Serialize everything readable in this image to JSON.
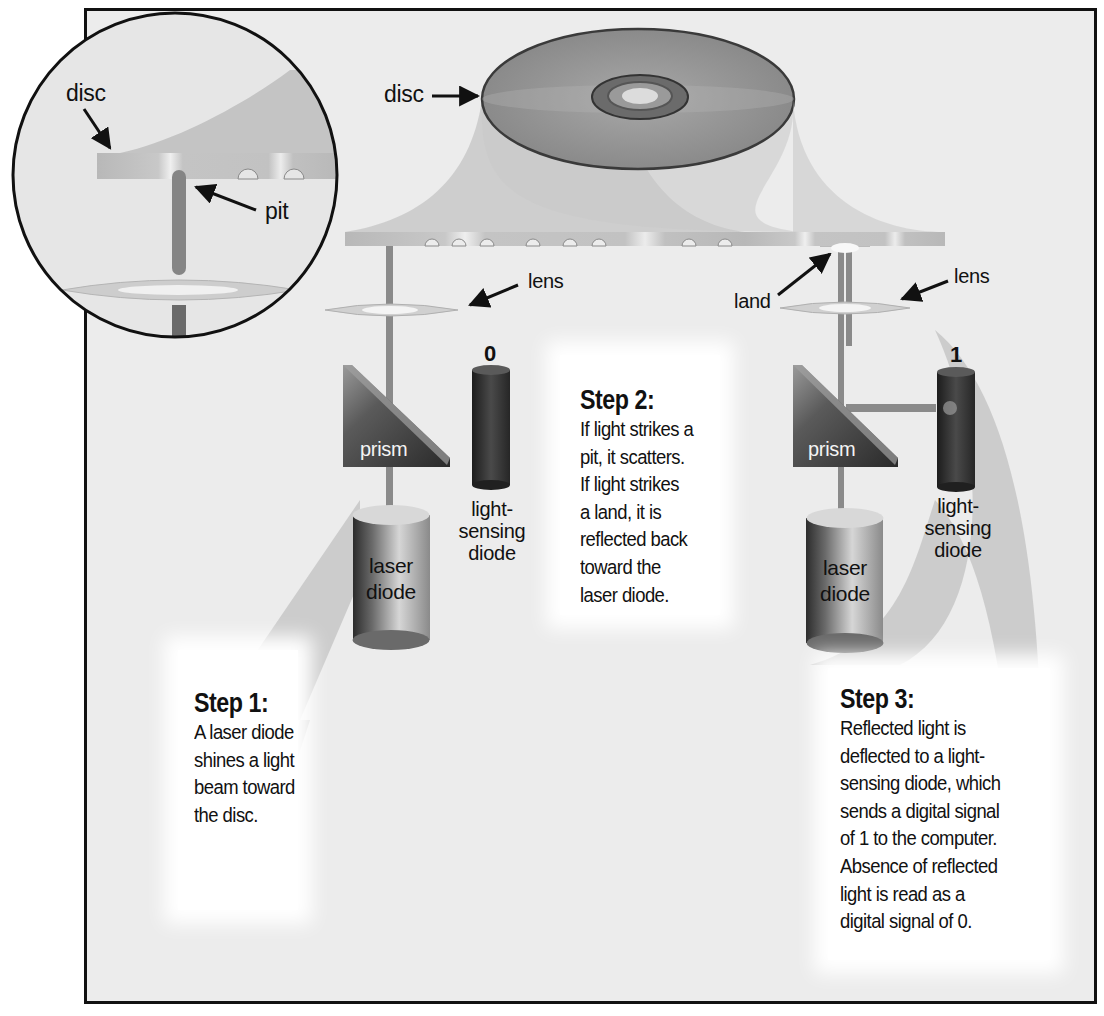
{
  "diagram": {
    "labels": {
      "magnifier_disc": "disc",
      "magnifier_pit": "pit",
      "top_disc": "disc",
      "left_lens": "lens",
      "right_lens": "lens",
      "land": "land",
      "left_prism": "prism",
      "right_prism": "prism",
      "left_sensor_value": "0",
      "right_sensor_value": "1",
      "left_sensor_line1": "light-",
      "left_sensor_line2": "sensing",
      "left_sensor_line3": "diode",
      "right_sensor_line1": "light-",
      "right_sensor_line2": "sensing",
      "right_sensor_line3": "diode",
      "left_laser_line1": "laser",
      "left_laser_line2": "diode",
      "right_laser_line1": "laser",
      "right_laser_line2": "diode"
    },
    "steps": [
      {
        "title": "Step 1:",
        "lines": [
          "A laser diode",
          "shines a light",
          "beam toward",
          "the disc."
        ]
      },
      {
        "title": "Step 2:",
        "lines": [
          "If light strikes a",
          "pit, it scatters.",
          "If light strikes",
          "a land, it is",
          "reflected back",
          "toward the",
          "laser diode."
        ]
      },
      {
        "title": "Step 3:",
        "lines": [
          "Reflected light is",
          "deflected to a light-",
          "sensing diode, which",
          "sends a digital signal",
          "of 1 to the computer.",
          "Absence of reflected",
          "light is read as a",
          "digital signal of 0."
        ]
      }
    ],
    "colors": {
      "background": "#ececec",
      "border": "#111111",
      "disc": "#8a8a8a",
      "beam": "#7d7d7d",
      "shadow": "#c4c4c4",
      "sensor": "#3a3a3a"
    }
  }
}
